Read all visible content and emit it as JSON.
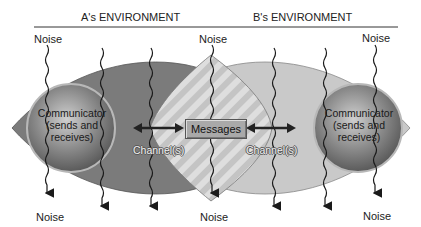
{
  "diagram": {
    "environments": {
      "a": "A's ENVIRONMENT",
      "b": "B's ENVIRONMENT"
    },
    "communicators": {
      "left": {
        "line1": "Communicator",
        "line2": "(sends and",
        "line3": "receives)"
      },
      "right": {
        "line1": "Communicator",
        "line2": "(sends and",
        "line3": "receives)"
      }
    },
    "messages_label": "Messages",
    "channel_labels": {
      "left": "Channel(s)",
      "right": "Channel(s)"
    },
    "noise_labels": {
      "top_left": "Noise",
      "top_center": "Noise",
      "top_right": "Noise",
      "bottom_left": "Noise",
      "bottom_center": "Noise",
      "bottom_right": "Noise"
    },
    "colors": {
      "a_environment": "#7a7a7a",
      "b_environment": "#c8c8c8",
      "overlap": "#d9d9d9",
      "sphere": "#8a8a8a",
      "lines": "#1a1a1a"
    }
  }
}
